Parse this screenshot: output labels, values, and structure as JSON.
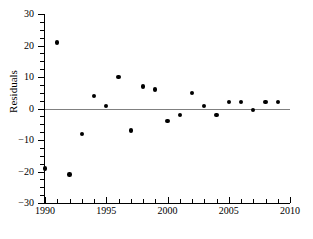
{
  "chart_data": {
    "type": "scatter",
    "title": "",
    "xlabel": "",
    "ylabel": "Residuals",
    "xlim": [
      1990,
      2010
    ],
    "ylim": [
      -30,
      30
    ],
    "grid": false,
    "legend": "none",
    "x_ticks": [
      1990,
      1995,
      2000,
      2005,
      2010
    ],
    "x_tick_labels": [
      "1990",
      "1995",
      "2000",
      "2005",
      "2010"
    ],
    "x_minor_tick_step": 1,
    "y_ticks": [
      30,
      20,
      10,
      0,
      -10,
      -20,
      -30
    ],
    "y_tick_labels": [
      "30",
      "20",
      "10",
      "0",
      "−10",
      "−20",
      "−30"
    ],
    "y_minor_tick_step": 2.5,
    "reference_line": {
      "name": "zero-line",
      "y": 0,
      "color": "#808080"
    },
    "marker": {
      "shape": "circle",
      "color": "#000000",
      "size": 4.4
    },
    "x": [
      1990,
      1991,
      1992,
      1993,
      1994,
      1995,
      1996,
      1997,
      1998,
      1999,
      2000,
      2001,
      2002,
      2003,
      2004,
      2005,
      2006,
      2007,
      2008,
      2009
    ],
    "values": [
      -19,
      21,
      -21,
      -8,
      4,
      0.7,
      10,
      -7,
      7,
      6,
      -4,
      -2,
      5,
      0.7,
      -2,
      2,
      2,
      -0.5,
      2,
      2
    ],
    "points": [
      {
        "x": 1990,
        "y": -19
      },
      {
        "x": 1991,
        "y": 21
      },
      {
        "x": 1992,
        "y": -21
      },
      {
        "x": 1993,
        "y": -8
      },
      {
        "x": 1994,
        "y": 4
      },
      {
        "x": 1995,
        "y": 0.7
      },
      {
        "x": 1996,
        "y": 10
      },
      {
        "x": 1997,
        "y": -7
      },
      {
        "x": 1998,
        "y": 7
      },
      {
        "x": 1999,
        "y": 6
      },
      {
        "x": 2000,
        "y": -4
      },
      {
        "x": 2001,
        "y": -2
      },
      {
        "x": 2002,
        "y": 5
      },
      {
        "x": 2003,
        "y": 0.7
      },
      {
        "x": 2004,
        "y": -2
      },
      {
        "x": 2005,
        "y": 2
      },
      {
        "x": 2006,
        "y": 2
      },
      {
        "x": 2007,
        "y": -0.5
      },
      {
        "x": 2008,
        "y": 2
      },
      {
        "x": 2009,
        "y": 2
      }
    ]
  },
  "caption": ""
}
